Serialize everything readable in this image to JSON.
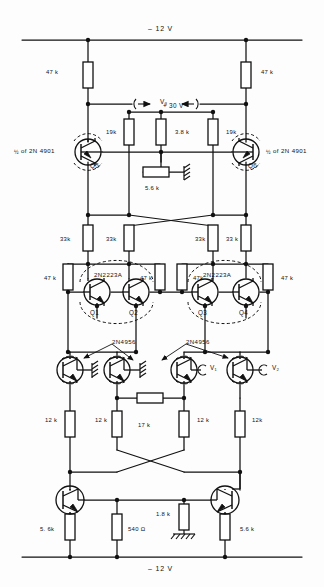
{
  "figure": {
    "type": "electronic-schematic",
    "title_text": "",
    "rails": {
      "top_label": "– 12 V",
      "bottom_label": "– 12 V",
      "mid_supply_label": "+ 30 V"
    },
    "annotations": {
      "v3": "V₃",
      "v1": "V₁",
      "v2": "V₂",
      "half_of_left": "of  2N 4901",
      "half_of_right": "of  2N 4901",
      "half_glyph": "½",
      "pair_left": "2N2223A",
      "pair_right": "2N2223A",
      "fet_left": "2N4956",
      "fet_right": "2N4956"
    },
    "transistors": [
      {
        "id": "Q5",
        "label": "Q5",
        "type": "pnp",
        "x": 88,
        "y": 152
      },
      {
        "id": "Q6",
        "label": "Q6",
        "type": "pnp",
        "x": 246,
        "y": 152
      },
      {
        "id": "Q1",
        "label": "Q1",
        "type": "npn",
        "x": 97,
        "y": 292
      },
      {
        "id": "Q2",
        "label": "Q2",
        "type": "npn",
        "x": 136,
        "y": 292
      },
      {
        "id": "Q3",
        "label": "Q3",
        "type": "npn",
        "x": 205,
        "y": 292
      },
      {
        "id": "Q4",
        "label": "Q4",
        "type": "npn",
        "x": 246,
        "y": 292
      },
      {
        "id": "J1",
        "label": "",
        "type": "fet",
        "x": 70,
        "y": 370
      },
      {
        "id": "J2",
        "label": "",
        "type": "fet",
        "x": 117,
        "y": 370
      },
      {
        "id": "J3",
        "label": "",
        "type": "fet",
        "x": 184,
        "y": 370
      },
      {
        "id": "J4",
        "label": "",
        "type": "fet",
        "x": 240,
        "y": 370
      },
      {
        "id": "Q7",
        "label": "",
        "type": "npn",
        "x": 70,
        "y": 500
      },
      {
        "id": "Q8",
        "label": "",
        "type": "npn",
        "x": 225,
        "y": 500
      }
    ],
    "resistors": [
      {
        "name": "R-top-left",
        "value": "47 k",
        "label_x": 46,
        "label_y": 70,
        "x": 88,
        "y": 75
      },
      {
        "name": "R-top-right",
        "value": "47 k",
        "label_x": 261,
        "label_y": 70,
        "x": 246,
        "y": 75
      },
      {
        "name": "R-19k-left",
        "value": "19k",
        "label_x": 106,
        "label_y": 130,
        "x": 129,
        "y": 132
      },
      {
        "name": "R-3k8",
        "value": "3.8 k",
        "label_x": 175,
        "label_y": 130,
        "x": 161,
        "y": 132
      },
      {
        "name": "R-19k-right",
        "value": "19k",
        "label_x": 226,
        "label_y": 130,
        "x": 213,
        "y": 132
      },
      {
        "name": "R-5k6-emit",
        "value": "5.6 k",
        "label_x": 145,
        "label_y": 186,
        "x": 156,
        "y": 172
      },
      {
        "name": "R-33k-1",
        "value": "33k",
        "label_x": 60,
        "label_y": 237,
        "x": 88,
        "y": 238
      },
      {
        "name": "R-33k-2",
        "value": "33k",
        "label_x": 106,
        "label_y": 237,
        "x": 129,
        "y": 238
      },
      {
        "name": "R-33k-3",
        "value": "33k",
        "label_x": 195,
        "label_y": 237,
        "x": 213,
        "y": 238
      },
      {
        "name": "R-33k-4",
        "value": "33 k",
        "label_x": 226,
        "label_y": 237,
        "x": 246,
        "y": 238
      },
      {
        "name": "R-47k-a",
        "value": "47 k",
        "label_x": 44,
        "label_y": 276,
        "x": 68,
        "y": 277
      },
      {
        "name": "R-47k-b",
        "value": "47 k",
        "label_x": 140,
        "label_y": 276,
        "x": 160,
        "y": 277
      },
      {
        "name": "R-47k-c",
        "value": "47k",
        "label_x": 193,
        "label_y": 276,
        "x": 182,
        "y": 277
      },
      {
        "name": "R-47k-d",
        "value": "47 k",
        "label_x": 281,
        "label_y": 276,
        "x": 268,
        "y": 277
      },
      {
        "name": "R-17k",
        "value": "17 k",
        "label_x": 138,
        "label_y": 423,
        "x": 150,
        "y": 409
      },
      {
        "name": "R-12k-1",
        "value": "12 k",
        "label_x": 45,
        "label_y": 418,
        "x": 70,
        "y": 424
      },
      {
        "name": "R-12k-2",
        "value": "12 k",
        "label_x": 95,
        "label_y": 418,
        "x": 117,
        "y": 424
      },
      {
        "name": "R-12k-3",
        "value": "12 k",
        "label_x": 197,
        "label_y": 418,
        "x": 184,
        "y": 424
      },
      {
        "name": "R-12k-4",
        "value": "12k",
        "label_x": 252,
        "label_y": 418,
        "x": 240,
        "y": 424
      },
      {
        "name": "R-5k6-left",
        "value": "5. 6k",
        "label_x": 40,
        "label_y": 527,
        "x": 70,
        "y": 527
      },
      {
        "name": "R-540",
        "value": "540 Ω",
        "label_x": 128,
        "label_y": 527,
        "x": 117,
        "y": 527
      },
      {
        "name": "R-1k8",
        "value": "1.8 k",
        "label_x": 156,
        "label_y": 512,
        "x": 184,
        "y": 517
      },
      {
        "name": "R-5k6-right",
        "value": "5.6 k",
        "label_x": 240,
        "label_y": 527,
        "x": 225,
        "y": 527
      }
    ],
    "grounds": [
      {
        "name": "gnd-5k6",
        "x": 188,
        "y": 172
      },
      {
        "name": "gnd-fet1",
        "x": 92,
        "y": 370
      },
      {
        "name": "gnd-fet2",
        "x": 140,
        "y": 370
      },
      {
        "name": "gnd-1k8",
        "x": 184,
        "y": 534
      }
    ]
  }
}
